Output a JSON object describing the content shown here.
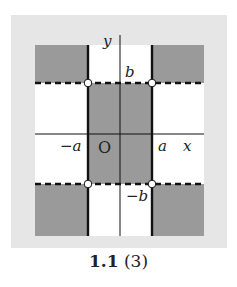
{
  "figure": {
    "caption_number": "1.1",
    "caption_sub": "(3)",
    "colors": {
      "panel_bg": "#e6e6e6",
      "shaded": "#9a9a9a",
      "region_bg": "#ffffff",
      "line": "#111111"
    },
    "axes": {
      "x_label": "x",
      "y_label": "y",
      "origin_label": "O"
    },
    "tick_labels": {
      "a": "a",
      "neg_a": "−a",
      "b": "b",
      "neg_b": "−b"
    }
  }
}
